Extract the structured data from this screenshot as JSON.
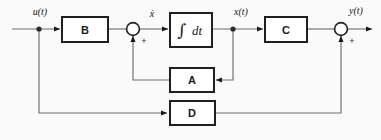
{
  "diagram": {
    "background_color": "#fbfafa",
    "line_color": "#6e6e6e",
    "block_border_color": "#1f1f1f",
    "block_fill_color": "#ffffff",
    "text_color": "#1a1a1a"
  },
  "blocks": {
    "b": {
      "label": "B"
    },
    "integrator": {
      "symbol": "∫",
      "label": "dt"
    },
    "c": {
      "label": "C"
    },
    "a": {
      "label": "A"
    },
    "d": {
      "label": "D"
    }
  },
  "signals": {
    "input": "u(t)",
    "xdot": "ẋ",
    "state": "x(t)",
    "output": "y(t)"
  },
  "signs": {
    "sum1_plus": "+",
    "sum2_plus": "+"
  },
  "junctions": {
    "sum1_name": "summing-junction-1",
    "sum2_name": "summing-junction-2"
  }
}
